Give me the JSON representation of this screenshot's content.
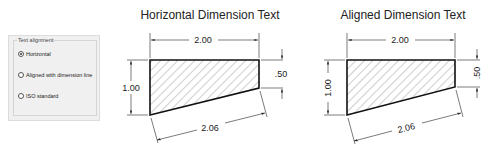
{
  "dialog": {
    "group_label": "Text alignment",
    "options": [
      {
        "label": "Horizontal",
        "checked": true
      },
      {
        "label": "Aligned with dimension line",
        "checked": false
      },
      {
        "label": "ISO standard",
        "checked": false
      }
    ]
  },
  "diagrams": [
    {
      "title": "Horizontal Dimension Text",
      "dims": {
        "top": "2.00",
        "left": "1.00",
        "right": ".50",
        "bottom": "2.06"
      }
    },
    {
      "title": "Aligned Dimension Text",
      "dims": {
        "top": "2.00",
        "left": "1.00",
        "right": ".50",
        "bottom": "2.06"
      }
    }
  ]
}
